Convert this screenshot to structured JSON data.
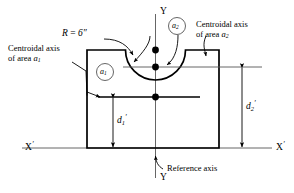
{
  "figure": {
    "type": "engineering-cross-section-diagram",
    "background_color": "#ffffff",
    "line_color": "#000000",
    "thin_line_color": "#555555"
  },
  "labels": {
    "axis_y_top": "Y",
    "axis_y_bottom": "Y",
    "axis_x_left": "X",
    "axis_x_left_prime": "′",
    "axis_x_right": "X",
    "axis_x_right_prime": "′",
    "radius_label": "R",
    "radius_equals": "=",
    "radius_value": "6″",
    "centroid_left_line1": "Centroidal axis",
    "centroid_left_line2_prefix": "of area ",
    "centroid_left_line2_symbol": "a",
    "centroid_left_line2_sub": "1",
    "centroid_right_line1": "Centroidal axis",
    "centroid_right_line2_prefix": "of area ",
    "centroid_right_line2_symbol": "a",
    "centroid_right_line2_sub": "2",
    "reference_axis": "Reference axis",
    "area_1_symbol": "a",
    "area_1_sub": "1",
    "area_2_symbol": "a",
    "area_2_sub": "2",
    "dim_d1_symbol": "d",
    "dim_d1_sub": "1",
    "dim_d1_prime": "′",
    "dim_d2_symbol": "d",
    "dim_d2_sub": "2",
    "dim_d2_prime": "′"
  },
  "geometry": {
    "rect_left": 87,
    "rect_right": 219,
    "rect_top": 50,
    "rect_bottom": 148,
    "y_axis_x": 155.5,
    "semicircle_center_x": 155.5,
    "semicircle_center_y": 50,
    "semicircle_radius": 30,
    "centroid_a1_y": 97,
    "centroid_a2_y": 67,
    "dot_top_y": 50,
    "dot_mid_y": 67,
    "dot_a1_y": 97
  }
}
